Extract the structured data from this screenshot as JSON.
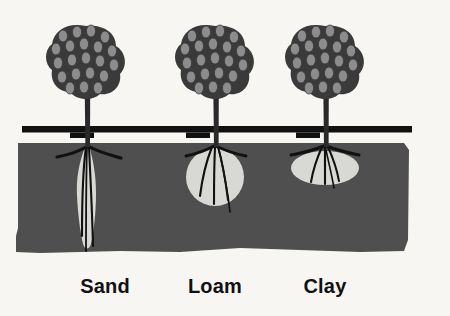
{
  "figure": {
    "background_color": "#f7f6f3",
    "soil_color": "#4f4f4f",
    "wetting_pattern_color": "#d8d8d4",
    "ink_color": "#111111",
    "foliage_dark_color": "#3a3a3a",
    "foliage_light_color": "#8c8c8c"
  },
  "irrigation_line": {
    "name": "drip-irrigation-lateral",
    "color": "#111111"
  },
  "ground": {
    "surface_label": "soil surface",
    "block_color": "#4f4f4f"
  },
  "columns": [
    {
      "id": "sand",
      "label": "Sand",
      "wetting_pattern": "narrow-deep-vertical",
      "pattern_shape": "elongated-teardrop",
      "tree": "tree-sand",
      "emitter": "emitter-sand"
    },
    {
      "id": "loam",
      "label": "Loam",
      "wetting_pattern": "round-balanced",
      "pattern_shape": "circle",
      "tree": "tree-loam",
      "emitter": "emitter-loam"
    },
    {
      "id": "clay",
      "label": "Clay",
      "wetting_pattern": "wide-shallow-lateral",
      "pattern_shape": "flat-ellipse",
      "tree": "tree-clay",
      "emitter": "emitter-clay"
    }
  ]
}
